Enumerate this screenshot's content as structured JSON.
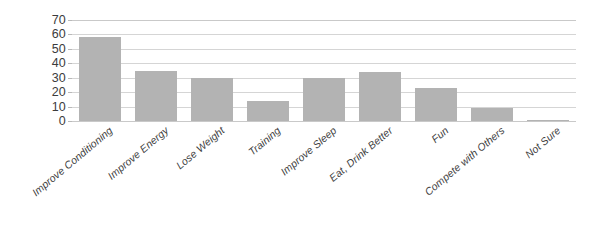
{
  "chart_data": {
    "type": "bar",
    "title": "",
    "subtitle": "",
    "xlabel": "",
    "ylabel": "",
    "categories": [
      "Improve Conditioning",
      "Improve Energy",
      "Lose Weight",
      "Training",
      "Improve Sleep",
      "Eat, Drink Better",
      "Fun",
      "Compete with Others",
      "Not Sure"
    ],
    "values": [
      58,
      35,
      30,
      14,
      30,
      34,
      23,
      9,
      1
    ],
    "ylim": [
      0,
      70
    ],
    "ytick_labels": [
      "70",
      "60",
      "50",
      "40",
      "30",
      "20",
      "10",
      "0"
    ],
    "ytick_values": [
      70,
      60,
      50,
      40,
      30,
      20,
      10,
      0
    ],
    "grid": true,
    "legend": false,
    "legend_position": "none",
    "xtick_label_rotation_deg": -40,
    "bar_color": "#b3b3b3",
    "gridline_color": "#d5d5d5",
    "axis_color": "#b9b9b9",
    "background_color": "#ffffff"
  }
}
